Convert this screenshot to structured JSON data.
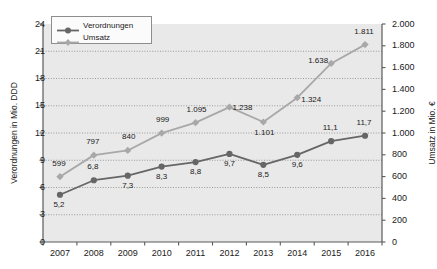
{
  "chart_data": {
    "type": "line",
    "title": "",
    "subtitle": "",
    "xlabel": "",
    "categories": [
      "2007",
      "2008",
      "2009",
      "2010",
      "2011",
      "2012",
      "2013",
      "2014",
      "2015",
      "2016"
    ],
    "grid": true,
    "legend_position": "top-left",
    "series": [
      {
        "name": "Verordnungen",
        "axis": "left",
        "unit": "Mio. DDD",
        "color": "#666666",
        "marker": "circle",
        "values": [
          5.2,
          6.8,
          7.3,
          8.3,
          8.8,
          9.7,
          8.5,
          9.6,
          11.1,
          11.7
        ],
        "labels": [
          "5,2",
          "6,8",
          "7,3",
          "8,3",
          "8,8",
          "9,7",
          "8,5",
          "9,6",
          "11,1",
          "11,7"
        ]
      },
      {
        "name": "Umsatz",
        "axis": "right",
        "unit": "Mio. €",
        "color": "#a8a8a8",
        "marker": "diamond",
        "values": [
          599,
          797,
          840,
          999,
          1095,
          1238,
          1101,
          1324,
          1638,
          1811
        ],
        "labels": [
          "599",
          "797",
          "840",
          "999",
          "1.095",
          "1.238",
          "1.101",
          "1.324",
          "1.638",
          "1.811"
        ]
      }
    ],
    "left_axis": {
      "label": "Verordnungen in Mio. DDD",
      "ylim": [
        0,
        24
      ],
      "ticks": [
        0,
        3,
        6,
        9,
        12,
        15,
        18,
        21,
        24
      ],
      "tick_labels": [
        "0",
        "3",
        "6",
        "9",
        "12",
        "15",
        "18",
        "21",
        "24"
      ]
    },
    "right_axis": {
      "label": "Umsatz  in Mio. €",
      "ylim": [
        0,
        2000
      ],
      "ticks": [
        0,
        200,
        400,
        600,
        800,
        1000,
        1200,
        1400,
        1600,
        1800,
        2000
      ],
      "tick_labels": [
        "0",
        "200",
        "400",
        "600",
        "800",
        "1.000",
        "1.200",
        "1.400",
        "1.600",
        "1.800",
        "2.000"
      ]
    },
    "legend": [
      {
        "label": "Verordnungen",
        "color": "#666666",
        "marker": "circle"
      },
      {
        "label": "Umsatz",
        "color": "#a8a8a8",
        "marker": "diamond"
      }
    ],
    "colors": {
      "plot_background": "#e9e9e9",
      "axis": "#5a5a5a",
      "gridline": "#8f8f8f",
      "text": "#1a1a1a",
      "series_verordnungen": "#666666",
      "series_umsatz": "#a8a8a8"
    }
  }
}
